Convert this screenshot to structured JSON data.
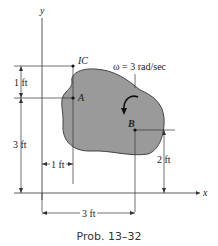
{
  "figure": {
    "caption": "Prob. 13–32",
    "axes": {
      "x_label": "x",
      "y_label": "y"
    },
    "points": {
      "ic": "IC",
      "a": "A",
      "b": "B"
    },
    "angular_velocity": "ω = 3 rad/sec",
    "dimensions": {
      "ic_to_a": "1 ft",
      "a_height": "3 ft",
      "a_x": "1 ft",
      "b_height": "2 ft",
      "b_x": "3 ft"
    },
    "colors": {
      "body_fill": "#9a9a9a",
      "line": "#333333"
    }
  }
}
